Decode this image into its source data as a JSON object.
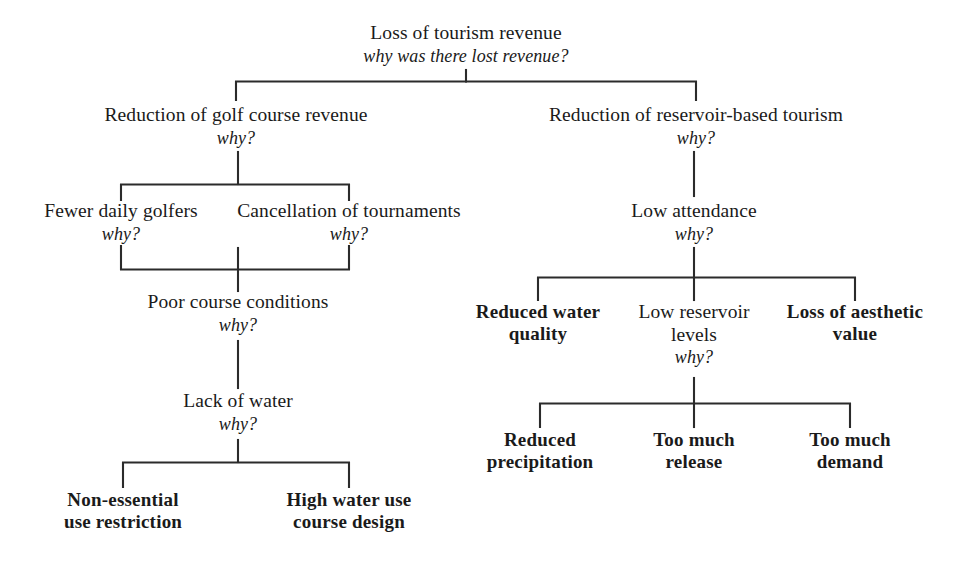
{
  "diagram": {
    "title": "Loss of tourism revenue",
    "type": "root-cause-why-tree",
    "why_label": "why?",
    "root_why_label": "why was there lost revenue?",
    "nodes": [
      {
        "id": "root",
        "label": "Loss of tourism revenue",
        "why": "why was there lost revenue?",
        "bold": false,
        "x": 466,
        "y": 22
      },
      {
        "id": "golf-revenue",
        "label": "Reduction of golf course revenue",
        "why": "why?",
        "bold": false,
        "x": 236,
        "y": 104
      },
      {
        "id": "reservoir-tourism",
        "label": "Reduction of reservoir-based tourism",
        "why": "why?",
        "bold": false,
        "x": 696,
        "y": 104
      },
      {
        "id": "fewer-golfers",
        "label": "Fewer daily golfers",
        "why": "why?",
        "bold": false,
        "x": 121,
        "y": 200
      },
      {
        "id": "cancelled-tournaments",
        "label": "Cancellation of tournaments",
        "why": "why?",
        "bold": false,
        "x": 349,
        "y": 200
      },
      {
        "id": "low-attendance",
        "label": "Low attendance",
        "why": "why?",
        "bold": false,
        "x": 694,
        "y": 200
      },
      {
        "id": "poor-course-conditions",
        "label": "Poor course conditions",
        "why": "why?",
        "bold": false,
        "x": 238,
        "y": 294
      },
      {
        "id": "reduced-water-quality",
        "label": "Reduced water quality",
        "why": "",
        "bold": true,
        "x": 538,
        "y": 303
      },
      {
        "id": "low-reservoir-levels",
        "label": "Low reservoir levels",
        "why": "why?",
        "bold": false,
        "x": 694,
        "y": 303
      },
      {
        "id": "loss-of-aesthetic-value",
        "label": "Loss of aesthetic value",
        "why": "",
        "bold": true,
        "x": 855,
        "y": 303
      },
      {
        "id": "lack-of-water",
        "label": "Lack of water",
        "why": "why?",
        "bold": false,
        "x": 238,
        "y": 393
      },
      {
        "id": "reduced-precipitation",
        "label": "Reduced precipitation",
        "why": "",
        "bold": true,
        "x": 540,
        "y": 430
      },
      {
        "id": "too-much-release",
        "label": "Too much release",
        "why": "",
        "bold": true,
        "x": 694,
        "y": 430
      },
      {
        "id": "too-much-demand",
        "label": "Too much demand",
        "why": "",
        "bold": true,
        "x": 850,
        "y": 430
      },
      {
        "id": "non-essential-use-restriction",
        "label": "Non-essential use restriction",
        "why": "",
        "bold": true,
        "x": 123,
        "y": 490
      },
      {
        "id": "high-water-use-course-design",
        "label": "High water use course design",
        "why": "",
        "bold": true,
        "x": 349,
        "y": 490
      }
    ],
    "node_text": {
      "root_line1": "Loss of tourism revenue",
      "root_line2": "why was there lost revenue?",
      "golf_line1": "Reduction of golf course revenue",
      "golf_line2": "why?",
      "reservoir_line1": "Reduction of reservoir-based tourism",
      "reservoir_line2": "why?",
      "golfers_line1": "Fewer daily golfers",
      "golfers_line2": "why?",
      "tournaments_line1": "Cancellation of tournaments",
      "tournaments_line2": "why?",
      "attendance_line1": "Low attendance",
      "attendance_line2": "why?",
      "conditions_line1": "Poor course conditions",
      "conditions_line2": "why?",
      "rwq_line1": "Reduced water",
      "rwq_line2": "quality",
      "lrl_line1": "Low reservoir",
      "lrl_line2": "levels",
      "lrl_line3": "why?",
      "loa_line1": "Loss of aesthetic",
      "loa_line2": "value",
      "lack_line1": "Lack of water",
      "lack_line2": "why?",
      "precip_line1": "Reduced",
      "precip_line2": "precipitation",
      "release_line1": "Too much",
      "release_line2": "release",
      "demand_line1": "Too much",
      "demand_line2": "demand",
      "nonessential_line1": "Non-essential",
      "nonessential_line2": "use restriction",
      "highwater_line1": "High water use",
      "highwater_line2": "course design"
    },
    "colors": {
      "background": "#ffffff",
      "text": "#1a1a1a",
      "connector": "#2b2b2b"
    }
  }
}
